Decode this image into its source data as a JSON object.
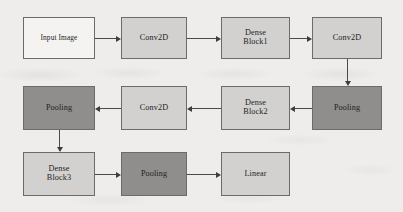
{
  "diagram": {
    "background_color": "#eeedeb",
    "fill_colors": {
      "white": "#f4f3f1",
      "light_gray": "#d2d1cf",
      "dark_gray": "#8f8e8c"
    },
    "border_color": "#6b6b6b",
    "edge_color": "#4a4a4a",
    "nodes": [
      {
        "id": "input-image",
        "label": "Input Image",
        "fill": "white",
        "x": 23,
        "y": 17,
        "w": 72,
        "h": 42,
        "font_size": 7.4
      },
      {
        "id": "conv2d-1",
        "label": "Conv2D",
        "fill": "light_gray",
        "x": 121,
        "y": 17,
        "w": 66,
        "h": 42,
        "font_size": 8.2
      },
      {
        "id": "dense-block1",
        "label": "Dense\nBlock1",
        "fill": "light_gray",
        "x": 221,
        "y": 17,
        "w": 69,
        "h": 42,
        "font_size": 8.2
      },
      {
        "id": "conv2d-2",
        "label": "Conv2D",
        "fill": "light_gray",
        "x": 312,
        "y": 17,
        "w": 70,
        "h": 42,
        "font_size": 8.2
      },
      {
        "id": "pooling-1",
        "label": "Pooling",
        "fill": "dark_gray",
        "x": 312,
        "y": 86,
        "w": 70,
        "h": 44,
        "font_size": 8.2
      },
      {
        "id": "dense-block2",
        "label": "Dense\nBlock2",
        "fill": "light_gray",
        "x": 221,
        "y": 86,
        "w": 69,
        "h": 44,
        "font_size": 8.2
      },
      {
        "id": "conv2d-3",
        "label": "Conv2D",
        "fill": "light_gray",
        "x": 121,
        "y": 86,
        "w": 66,
        "h": 44,
        "font_size": 8.2
      },
      {
        "id": "pooling-2",
        "label": "Pooling",
        "fill": "dark_gray",
        "x": 23,
        "y": 86,
        "w": 72,
        "h": 44,
        "font_size": 8.2
      },
      {
        "id": "dense-block3",
        "label": "Dense\nBlock3",
        "fill": "light_gray",
        "x": 23,
        "y": 152,
        "w": 72,
        "h": 44,
        "font_size": 8.2
      },
      {
        "id": "pooling-3",
        "label": "Pooling",
        "fill": "dark_gray",
        "x": 121,
        "y": 152,
        "w": 66,
        "h": 44,
        "font_size": 8.2
      },
      {
        "id": "linear",
        "label": "Linear",
        "fill": "light_gray",
        "x": 221,
        "y": 152,
        "w": 69,
        "h": 44,
        "font_size": 8.2
      }
    ],
    "edges": [
      {
        "id": "input-image-to-conv2d-1",
        "from": "input-image",
        "to": "conv2d-1",
        "direction": "right"
      },
      {
        "id": "conv2d-1-to-dense-block1",
        "from": "conv2d-1",
        "to": "dense-block1",
        "direction": "right"
      },
      {
        "id": "dense-block1-to-conv2d-2",
        "from": "dense-block1",
        "to": "conv2d-2",
        "direction": "right"
      },
      {
        "id": "conv2d-2-to-pooling-1",
        "from": "conv2d-2",
        "to": "pooling-1",
        "direction": "down"
      },
      {
        "id": "pooling-1-to-dense-block2",
        "from": "pooling-1",
        "to": "dense-block2",
        "direction": "left"
      },
      {
        "id": "dense-block2-to-conv2d-3",
        "from": "dense-block2",
        "to": "conv2d-3",
        "direction": "left"
      },
      {
        "id": "conv2d-3-to-pooling-2",
        "from": "conv2d-3",
        "to": "pooling-2",
        "direction": "left"
      },
      {
        "id": "pooling-2-to-dense-block3",
        "from": "pooling-2",
        "to": "dense-block3",
        "direction": "down"
      },
      {
        "id": "dense-block3-to-pooling-3",
        "from": "dense-block3",
        "to": "pooling-3",
        "direction": "right"
      },
      {
        "id": "pooling-3-to-linear",
        "from": "pooling-3",
        "to": "linear",
        "direction": "right"
      }
    ]
  }
}
